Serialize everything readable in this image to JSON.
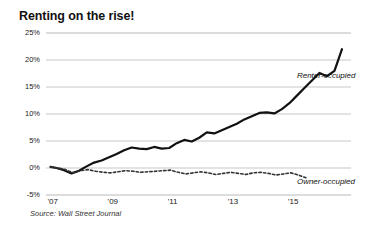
{
  "chart_data": {
    "type": "line",
    "title": "Renting on the rise!",
    "subtitle": "",
    "xlabel": "",
    "ylabel": "",
    "source": "Source: Wall Street Journal",
    "grid": true,
    "legend_position": "inline-right",
    "xlim": [
      2006.75,
      2016.9
    ],
    "ylim": [
      -5,
      25
    ],
    "ytick_values": [
      25,
      20,
      15,
      10,
      5,
      0,
      -5
    ],
    "ytick_labels": [
      "25%",
      "20%",
      "15%",
      "10%",
      "5%",
      "0%",
      "-5%"
    ],
    "xtick_values": [
      2007,
      2009,
      2011,
      2013,
      2015
    ],
    "xtick_labels": [
      "'07",
      "'09",
      "'11",
      "'13",
      "'15"
    ],
    "series": [
      {
        "name": "Renter-occupied",
        "style": "solid",
        "color": "#111111",
        "width": 2.2,
        "x": [
          2006.9,
          2007.1,
          2007.35,
          2007.6,
          2007.85,
          2008.1,
          2008.35,
          2008.6,
          2008.85,
          2009.1,
          2009.35,
          2009.6,
          2009.85,
          2010.1,
          2010.35,
          2010.6,
          2010.85,
          2011.1,
          2011.35,
          2011.6,
          2011.85,
          2012.1,
          2012.35,
          2012.6,
          2012.85,
          2013.1,
          2013.35,
          2013.6,
          2013.85,
          2014.1,
          2014.35,
          2014.6,
          2014.85,
          2015.1,
          2015.35,
          2015.6,
          2015.85,
          2016.1,
          2016.35,
          2016.6
        ],
        "y": [
          0.2,
          0.0,
          -0.4,
          -1.0,
          -0.5,
          0.3,
          1.0,
          1.4,
          2.0,
          2.6,
          3.3,
          3.8,
          3.6,
          3.5,
          3.9,
          3.6,
          3.7,
          4.6,
          5.2,
          4.9,
          5.6,
          6.6,
          6.4,
          7.0,
          7.6,
          8.2,
          9.0,
          9.6,
          10.2,
          10.3,
          10.1,
          10.9,
          12.0,
          13.4,
          14.8,
          16.2,
          17.6,
          17.0,
          18.0,
          22.0
        ]
      },
      {
        "name": "Owner-occupied",
        "style": "dashed",
        "color": "#333333",
        "width": 1.6,
        "x": [
          2006.9,
          2007.15,
          2007.4,
          2007.65,
          2007.9,
          2008.15,
          2008.4,
          2008.65,
          2008.9,
          2009.15,
          2009.4,
          2009.65,
          2009.9,
          2010.15,
          2010.4,
          2010.65,
          2010.9,
          2011.15,
          2011.4,
          2011.65,
          2011.9,
          2012.15,
          2012.4,
          2012.65,
          2012.9,
          2013.15,
          2013.4,
          2013.65,
          2013.9,
          2014.15,
          2014.4,
          2014.65,
          2014.9,
          2015.15,
          2015.4
        ],
        "y": [
          0.2,
          0.0,
          -0.3,
          -0.9,
          -0.5,
          -0.3,
          -0.6,
          -0.8,
          -0.9,
          -0.7,
          -0.5,
          -0.6,
          -0.8,
          -0.7,
          -0.6,
          -0.5,
          -0.4,
          -0.8,
          -1.1,
          -0.9,
          -0.7,
          -0.9,
          -1.2,
          -1.0,
          -0.8,
          -1.0,
          -1.2,
          -0.9,
          -0.8,
          -1.0,
          -1.3,
          -1.1,
          -0.9,
          -1.3,
          -1.8
        ]
      }
    ],
    "annotations": [
      {
        "text": "Renter-occupied",
        "x": 2015.1,
        "y": 17.0
      },
      {
        "text": "Owner-occupied",
        "x": 2015.1,
        "y": -2.6
      }
    ]
  },
  "axis_colors": {
    "grid": "#b9b9b9",
    "text": "#222222",
    "renter": "#111111",
    "owner": "#333333"
  }
}
